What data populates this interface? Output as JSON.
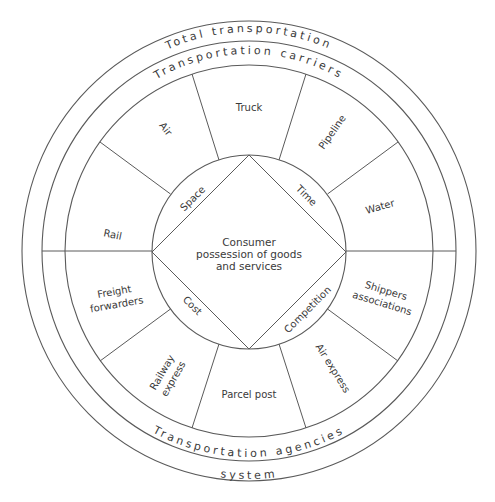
{
  "diagram": {
    "outer_rings": {
      "top_outer": "Total transportation",
      "top_inner": "Transportation carriers",
      "bottom_inner": "Transportation agencies",
      "bottom_outer": "system"
    },
    "carriers": [
      {
        "label": "Rail"
      },
      {
        "label": "Air"
      },
      {
        "label": "Truck"
      },
      {
        "label": "Pipeline"
      },
      {
        "label": "Water"
      }
    ],
    "agencies": [
      {
        "label_lines": [
          "Shippers",
          "associations"
        ]
      },
      {
        "label": "Air express"
      },
      {
        "label": "Parcel post"
      },
      {
        "label_lines": [
          "Railway",
          "express"
        ]
      },
      {
        "label_lines": [
          "Freight",
          "forwarders"
        ]
      }
    ],
    "utilities": {
      "top_left": "Space",
      "top_right": "Time",
      "bottom_left": "Cost",
      "bottom_right": "Competition"
    },
    "center": {
      "lines": [
        "Consumer",
        "possession of goods",
        "and services"
      ]
    },
    "colors": {
      "line": "#5a5a5a",
      "text": "#3a3a3a",
      "background": "#ffffff"
    }
  }
}
